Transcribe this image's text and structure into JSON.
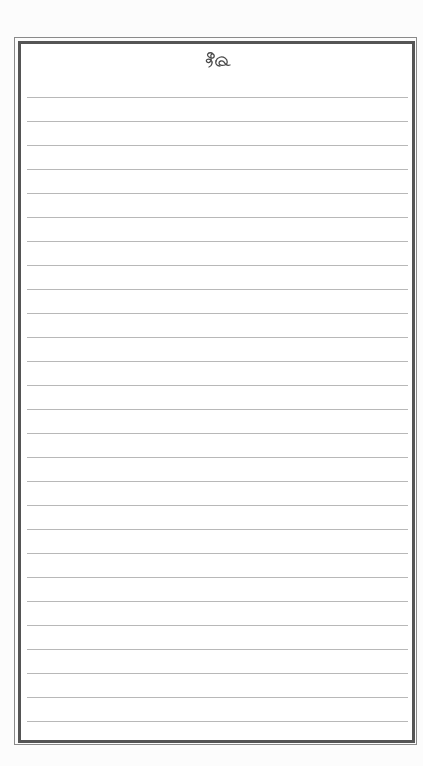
{
  "page": {
    "type": "lined-notepaper",
    "ornament": "flourish-ornament",
    "ruled_line_count": 27,
    "first_line_y": 97,
    "line_spacing": 24
  },
  "colors": {
    "background": "#fcfcfc",
    "paper": "#ffffff",
    "outer_border": "#8a8a8a",
    "inner_border": "#555555",
    "rule_line": "#b8b8b8",
    "ornament": "#4a4a4a"
  }
}
